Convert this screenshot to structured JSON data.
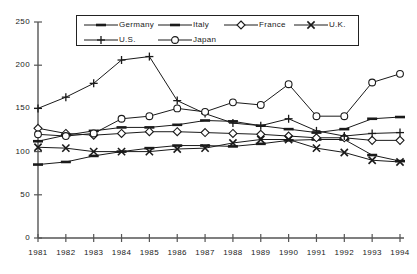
{
  "chart_data": {
    "type": "line",
    "title": "",
    "xlabel": "",
    "ylabel": "",
    "x": [
      1981,
      1982,
      1983,
      1984,
      1985,
      1986,
      1987,
      1988,
      1989,
      1990,
      1991,
      1992,
      1993,
      1994
    ],
    "categories": [
      "1981",
      "1982",
      "1983",
      "1984",
      "1985",
      "1986",
      "1987",
      "1988",
      "1989",
      "1990",
      "1991",
      "1992",
      "1993",
      "1994"
    ],
    "ylim": [
      0,
      250
    ],
    "yticks": [
      0,
      50,
      100,
      150,
      200,
      250
    ],
    "ytick_labels": [
      "0",
      "50",
      "100",
      "150",
      "200",
      "250"
    ],
    "grid": false,
    "legend_position": "top-center",
    "series": [
      {
        "name": "Germany",
        "marker": "dash",
        "values": [
          112,
          119,
          124,
          128,
          128,
          131,
          136,
          135,
          130,
          126,
          122,
          126,
          138,
          140
        ]
      },
      {
        "name": "Italy",
        "marker": "dash",
        "values": [
          85,
          88,
          95,
          100,
          104,
          107,
          107,
          106,
          109,
          113,
          114,
          114,
          96,
          89
        ]
      },
      {
        "name": "France",
        "marker": "diamond",
        "values": [
          127,
          121,
          119,
          121,
          123,
          123,
          122,
          121,
          120,
          118,
          116,
          116,
          113,
          113
        ]
      },
      {
        "name": "U.K.",
        "marker": "cross",
        "values": [
          105,
          104,
          100,
          100,
          100,
          103,
          104,
          110,
          114,
          114,
          104,
          99,
          90,
          88
        ]
      },
      {
        "name": "U.S.",
        "marker": "plus",
        "values": [
          150,
          163,
          179,
          206,
          210,
          159,
          144,
          133,
          130,
          138,
          124,
          118,
          121,
          122
        ]
      },
      {
        "name": "Japan",
        "marker": "circle",
        "values": [
          120,
          118,
          121,
          138,
          141,
          150,
          146,
          157,
          154,
          178,
          141,
          141,
          180,
          190
        ]
      }
    ]
  },
  "legend": {
    "rows": [
      [
        {
          "label": "Germany",
          "marker": "dash"
        },
        {
          "label": "Italy",
          "marker": "dash"
        },
        {
          "label": "France",
          "marker": "diamond"
        },
        {
          "label": "U.K.",
          "marker": "cross"
        }
      ],
      [
        {
          "label": "U.S.",
          "marker": "plus"
        },
        {
          "label": "Japan",
          "marker": "circle"
        }
      ]
    ]
  },
  "style": {
    "line_color": "#1a1a1a",
    "axis_color": "#555555",
    "background": "#ffffff"
  }
}
